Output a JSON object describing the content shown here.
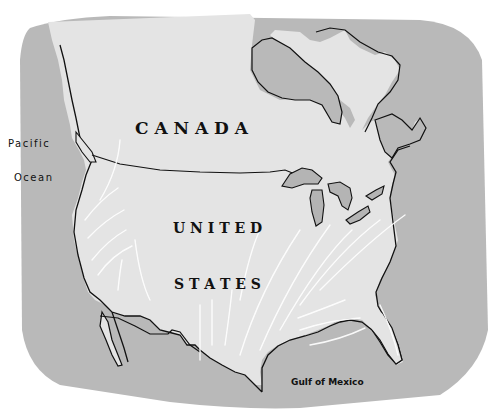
{
  "map": {
    "colors": {
      "background": "#ffffff",
      "water": "#b9b9b9",
      "land": "#e4e4e4",
      "lakes": "#b4b4b4",
      "outline": "#111111",
      "arrows": "#ffffff"
    },
    "labels": {
      "country_canada": "C A N A D A",
      "country_us_line1": "U N I T E D",
      "country_us_line2": "S T A T E S",
      "water_pacific_line1": "Pacific",
      "water_pacific_line2": "Ocean",
      "water_gulf": "Gulf of Mexico"
    },
    "features": {
      "arrows": "wind / air-mass flow arrows (white)",
      "lakes": "Great Lakes",
      "bays": [
        "Hudson Bay",
        "Gulf of California",
        "Gulf of St. Lawrence"
      ]
    }
  }
}
